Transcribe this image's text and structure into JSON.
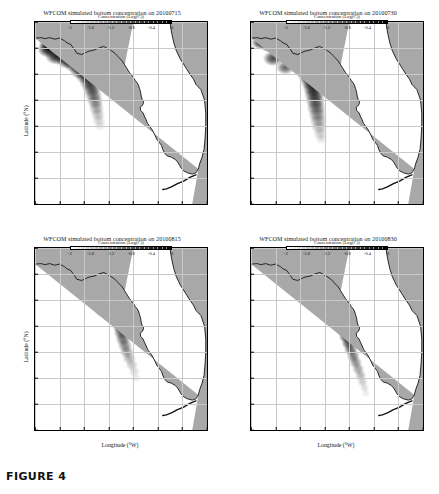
{
  "figure": {
    "caption_label": "FIGURE 4"
  },
  "axes": {
    "xlabel": "Longitude (°W)",
    "ylabel": "Latitude (°N)",
    "xticks": [
      "87",
      "86",
      "85",
      "84",
      "83",
      "82",
      "81",
      "80"
    ],
    "yticks": [
      "31",
      "30",
      "29",
      "28",
      "27",
      "26",
      "25",
      "24"
    ],
    "xlim": [
      -87,
      -80
    ],
    "ylim": [
      24,
      31
    ]
  },
  "colorbar": {
    "title": "Concentration (Log(C))",
    "ticks": [
      "-2",
      "-1.6",
      "-1.2",
      "-0.8",
      "-0.4",
      "0"
    ],
    "range": [
      -2,
      0
    ],
    "low_color": "#ffffff",
    "high_color": "#000000"
  },
  "colors": {
    "land": "#a8a8a8",
    "ocean": "#ffffff",
    "coastline": "#141414",
    "grid": "#c9c9c9",
    "plume_dark": "#101010"
  },
  "panels": [
    {
      "id": "panel-20100715",
      "title": "WFCOM simulated bottom concentration on 20100715",
      "date": "20100715"
    },
    {
      "id": "panel-20100730",
      "title": "WFCOM simulated bottom concentration on 20100730",
      "date": "20100730"
    },
    {
      "id": "panel-20100815",
      "title": "WFCOM simulated bottom concentration on 20100815",
      "date": "20100815"
    },
    {
      "id": "panel-20100830",
      "title": "WFCOM simulated bottom concentration on 20100830",
      "date": "20100830"
    }
  ],
  "chart_data": {
    "type": "heatmap",
    "xlabel": "Longitude (°W)",
    "ylabel": "Latitude (°N)",
    "xlim": [
      -87,
      -80
    ],
    "ylim": [
      24,
      31
    ],
    "xticks": [
      -87,
      -86,
      -85,
      -84,
      -83,
      -82,
      -81,
      -80
    ],
    "yticks": [
      24,
      25,
      26,
      27,
      28,
      29,
      30,
      31
    ],
    "grid": true,
    "colorbar": {
      "label": "Concentration (Log(C))",
      "vmin": -2,
      "vmax": 0,
      "ticks": [
        -2,
        -1.6,
        -1.2,
        -0.8,
        -0.4,
        0
      ],
      "colormap": "grayscale-reversed"
    },
    "panel_layout": "2x2",
    "panels": [
      {
        "date": "20100715",
        "title": "WFCOM simulated bottom concentration on 20100715",
        "plume_description": "Dense near-black patch hugging the Florida Panhandle coast near 30°N, 86°W, elongated southeast along the shelf to about 27°N, 84°W",
        "plume_centroid": [
          -85.6,
          29.3
        ],
        "peak_logC": 0,
        "extent_lat": [
          26.8,
          30.4
        ],
        "extent_lon": [
          -86.6,
          -83.5
        ]
      },
      {
        "date": "20100730",
        "title": "WFCOM simulated bottom concentration on 20100730",
        "plume_description": "Broad dark band from the Panhandle at 30°N sweeping southeast, widening across the shelf and reaching about 26.5°N near 83°W",
        "plume_centroid": [
          -85.2,
          28.8
        ],
        "peak_logC": 0,
        "extent_lat": [
          26.3,
          30.4
        ],
        "extent_lon": [
          -86.8,
          -82.8
        ]
      },
      {
        "date": "20100815",
        "title": "WFCOM simulated bottom concentration on 20100815",
        "plume_description": "Narrower band shifted east and nearshore, running from about 30°N, 84.5°W south-southeast along the coast to near 26°N, 82.5°W",
        "plume_centroid": [
          -84.0,
          28.3
        ],
        "peak_logC": 0,
        "extent_lat": [
          25.6,
          30.2
        ],
        "extent_lon": [
          -85.4,
          -82.2
        ]
      },
      {
        "date": "20100830",
        "title": "WFCOM simulated bottom concentration on 20100830",
        "plume_description": "Elongated coastal band tracking the west Florida shoreline from about 30°N down past 26°N, strongest between 29°N and 27°N near 83°W",
        "plume_centroid": [
          -83.6,
          27.9
        ],
        "peak_logC": 0,
        "extent_lat": [
          25.2,
          30.2
        ],
        "extent_lon": [
          -84.8,
          -81.9
        ]
      }
    ]
  }
}
